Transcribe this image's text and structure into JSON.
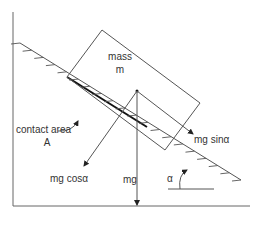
{
  "diagram": {
    "labels": {
      "mass_line1": "mass",
      "mass_line2": "m",
      "contact_line1": "contact area",
      "contact_line2": "A",
      "weight": "mg",
      "normal_component": "mg cosα",
      "parallel_component": "mg sinα",
      "angle": "α"
    },
    "colors": {
      "line": "#555555",
      "contact": "#111111",
      "text": "#333333"
    }
  }
}
